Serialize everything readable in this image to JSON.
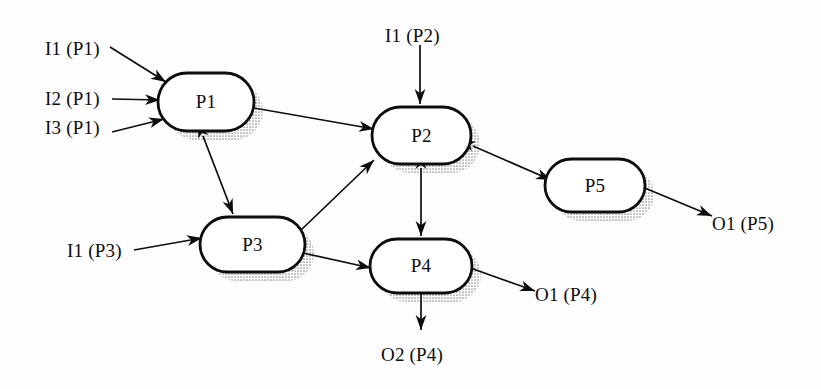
{
  "diagram": {
    "type": "process-flow",
    "background_color": "#fdfdfd",
    "stroke_color": "#0d0d0d",
    "node_fill_color": "#ffffff",
    "shadow_color": "#9a9a9a",
    "nodes": [
      {
        "id": "P1",
        "label": "P1",
        "x": 158,
        "y": 73,
        "w": 96,
        "h": 58
      },
      {
        "id": "P2",
        "label": "P2",
        "x": 372,
        "y": 107,
        "w": 99,
        "h": 57
      },
      {
        "id": "P3",
        "label": "P3",
        "x": 200,
        "y": 217,
        "w": 105,
        "h": 55
      },
      {
        "id": "P4",
        "label": "P4",
        "x": 370,
        "y": 239,
        "w": 102,
        "h": 54
      },
      {
        "id": "P5",
        "label": "P5",
        "x": 545,
        "y": 159,
        "w": 100,
        "h": 53
      }
    ],
    "inputs": [
      {
        "id": "I1P1",
        "label": "I1 (P1)",
        "x": 45,
        "y": 38,
        "target": "P1"
      },
      {
        "id": "I2P1",
        "label": "I2 (P1)",
        "x": 45,
        "y": 88,
        "target": "P1"
      },
      {
        "id": "I3P1",
        "label": "I3 (P1)",
        "x": 45,
        "y": 117,
        "target": "P1"
      },
      {
        "id": "I1P2",
        "label": "I1 (P2)",
        "x": 385,
        "y": 25,
        "target": "P2"
      },
      {
        "id": "I1P3",
        "label": "I1 (P3)",
        "x": 67,
        "y": 240,
        "target": "P3"
      }
    ],
    "outputs": [
      {
        "id": "O1P5",
        "label": "O1 (P5)",
        "x": 712,
        "y": 213,
        "source": "P5"
      },
      {
        "id": "O1P4",
        "label": "O1 (P4)",
        "x": 535,
        "y": 284,
        "source": "P4"
      },
      {
        "id": "O2P4",
        "label": "O2 (P4)",
        "x": 381,
        "y": 344,
        "source": "P4"
      }
    ],
    "edges": [
      {
        "from": "P1",
        "to": "P2",
        "bidirectional": false
      },
      {
        "from": "P1",
        "to": "P3",
        "bidirectional": true
      },
      {
        "from": "P3",
        "to": "P2",
        "bidirectional": true
      },
      {
        "from": "P3",
        "to": "P4",
        "bidirectional": false
      },
      {
        "from": "P2",
        "to": "P4",
        "bidirectional": true
      },
      {
        "from": "P2",
        "to": "P5",
        "bidirectional": true
      }
    ]
  }
}
